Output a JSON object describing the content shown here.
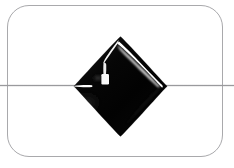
{
  "image": {
    "kind": "product-photograph",
    "subject": "black glossy diamond-shaped bead strung on a wire",
    "width": 234,
    "height": 168,
    "background_color": "#ffffff",
    "alt_text": "Black faceted diamond-shaped bead on a thin stringing wire, photographed on a white background inside a rounded rectangular frame."
  },
  "frame": {
    "name": "rounded-rectangle-border",
    "stroke_color": "#a9a9ac",
    "stroke_width_px": 1,
    "corner_radius_px": 22,
    "left_px": 7,
    "top_px": 5,
    "width_px": 216,
    "height_px": 152
  },
  "wire": {
    "name": "stringing-wire",
    "color": "#9a9a9d",
    "y_px": 85,
    "thickness_px": 1,
    "spans_full_width": true
  },
  "bead": {
    "name": "black-diamond-bead",
    "shape": "rhombus",
    "body_color": "#050505",
    "edge_color": "#1a1a1a",
    "center_x_px": 120,
    "center_y_px": 86,
    "left_vertex_x_px": 73,
    "right_vertex_x_px": 168,
    "top_vertex_y_px": 36,
    "bottom_vertex_y_px": 137,
    "width_px": 95,
    "height_px": 101,
    "finish": "high-gloss",
    "highlights": [
      {
        "name": "upper-right-rim-highlight",
        "color": "#ffffff",
        "description": "curved white specular band following the upper-right edge from apex toward right vertex"
      },
      {
        "name": "upper-left-rim-highlight",
        "color": "#f2f2f2",
        "description": "thin white specular streak along the upper-left edge near the apex"
      },
      {
        "name": "square-glint",
        "color": "#f8f8f8",
        "description": "small bright rectangular reflection inside the upper-left quadrant"
      },
      {
        "name": "drill-hole-glint",
        "color": "#ffffff",
        "description": "bright horizontal sliver at the left vertex where the wire enters the drill hole"
      },
      {
        "name": "lower-left-sheen",
        "color": "#2c2c2c",
        "description": "faint soft grey sheen along the lower-left facet"
      }
    ]
  }
}
